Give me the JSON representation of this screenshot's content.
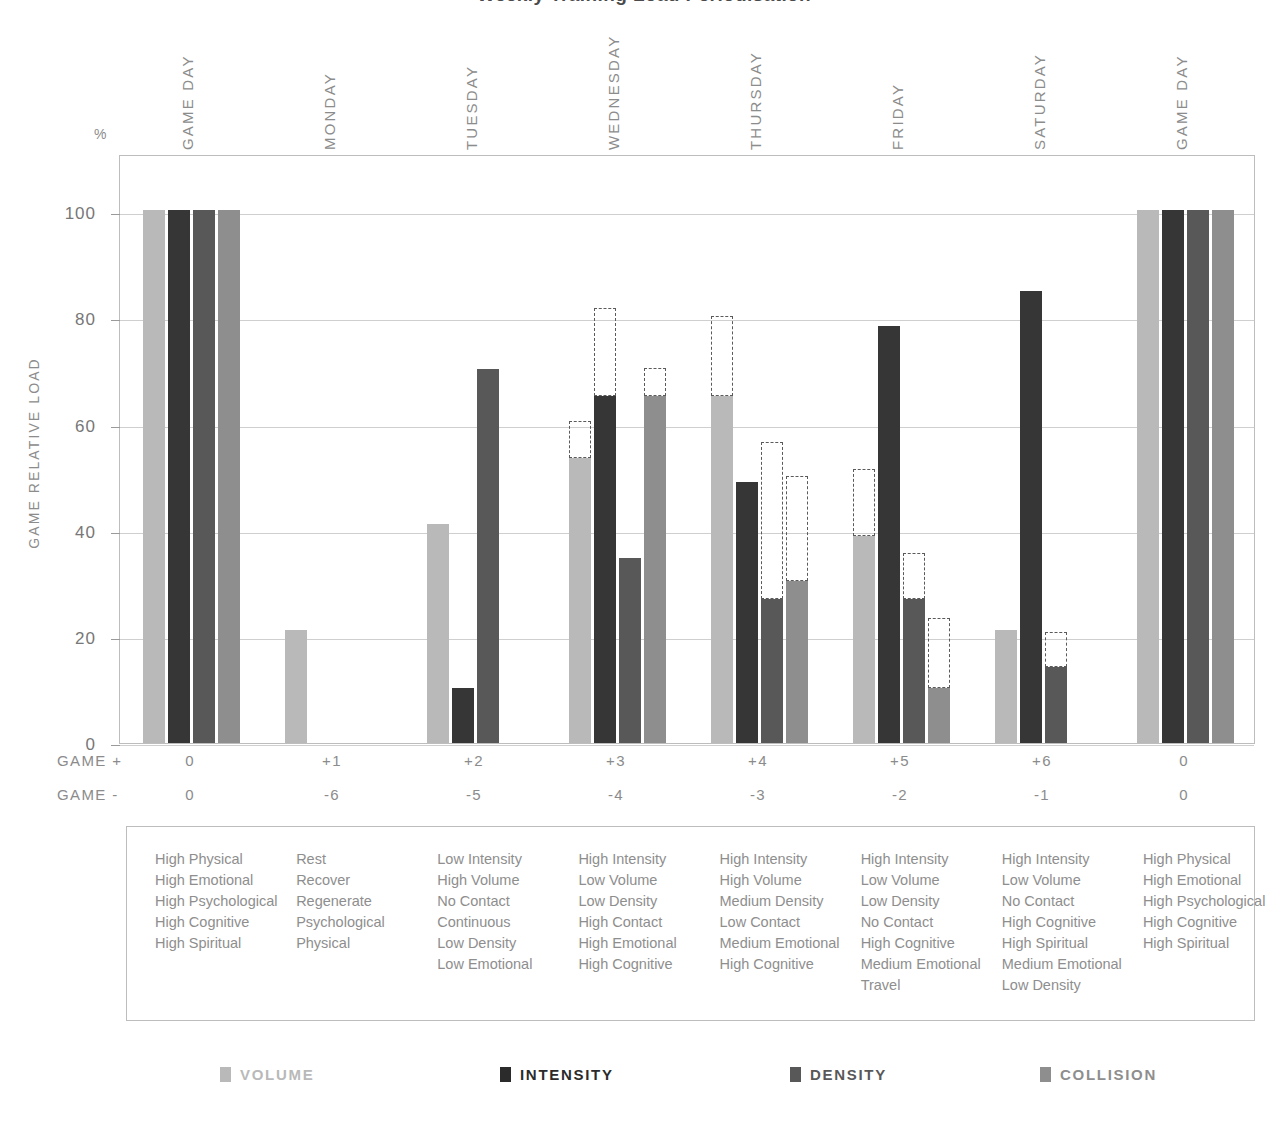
{
  "title": "Weekly Training Load Periodisation",
  "axes": {
    "y_unit": "%",
    "y_title": "GAME RELATIVE LOAD",
    "y_ticks": [
      0,
      20,
      40,
      60,
      80,
      100
    ],
    "y_min": 0,
    "y_max": 111,
    "row_label_plus": "GAME +",
    "row_label_minus": "GAME -"
  },
  "chart_data": {
    "type": "bar",
    "title": "Weekly Training Load Periodisation",
    "xlabel": "",
    "ylabel": "GAME RELATIVE LOAD",
    "y_unit": "%",
    "ylim": [
      0,
      111
    ],
    "grid": true,
    "legend_position": "bottom",
    "categories": [
      "GAME DAY",
      "MONDAY",
      "TUESDAY",
      "WEDNESDAY",
      "THURSDAY",
      "FRIDAY",
      "SATURDAY",
      "GAME DAY"
    ],
    "game_plus": [
      "0",
      "+1",
      "+2",
      "+3",
      "+4",
      "+5",
      "+6",
      "0"
    ],
    "game_minus": [
      "0",
      "-6",
      "-5",
      "-4",
      "-3",
      "-2",
      "-1",
      "0"
    ],
    "series": [
      {
        "name": "VOLUME",
        "color": "#b9b9b9",
        "values": [
          100.5,
          21.3,
          41.2,
          53.8,
          65.4,
          39.0,
          21.3,
          100.5
        ],
        "target_values": [
          null,
          null,
          null,
          60.6,
          80.4,
          51.6,
          null,
          null
        ]
      },
      {
        "name": "INTENSITY",
        "color": "#363636",
        "values": [
          100.5,
          null,
          10.4,
          65.4,
          49.2,
          78.5,
          85.2,
          100.5
        ],
        "target_values": [
          null,
          null,
          null,
          81.9,
          null,
          null,
          null,
          null
        ]
      },
      {
        "name": "DENSITY",
        "color": "#585858",
        "values": [
          100.5,
          null,
          70.4,
          34.8,
          27.1,
          27.2,
          14.3,
          100.5
        ],
        "target_values": [
          null,
          null,
          null,
          null,
          56.7,
          35.8,
          21.0,
          null
        ]
      },
      {
        "name": "COLLISION",
        "color": "#8e8e8e",
        "values": [
          100.5,
          null,
          null,
          65.4,
          30.6,
          10.4,
          null,
          100.5
        ],
        "target_values": [
          null,
          null,
          null,
          70.6,
          50.4,
          23.6,
          null,
          null
        ]
      }
    ]
  },
  "legend": [
    {
      "label": "VOLUME",
      "color": "#b9b9b9",
      "text_color": "#b9b9b9"
    },
    {
      "label": "INTENSITY",
      "color": "#2b2b2b",
      "text_color": "#2b2b2b"
    },
    {
      "label": "DENSITY",
      "color": "#585858",
      "text_color": "#585858"
    },
    {
      "label": "COLLISION",
      "color": "#8e8e8e",
      "text_color": "#8e8e8e"
    }
  ],
  "descriptors": [
    {
      "day": "GAME DAY",
      "lines": [
        "High Physical",
        "High Emotional",
        "High Psychological",
        "High Cognitive",
        "High Spiritual"
      ]
    },
    {
      "day": "MONDAY",
      "lines": [
        "Rest",
        "Recover",
        "Regenerate",
        "Psychological",
        "Physical"
      ]
    },
    {
      "day": "TUESDAY",
      "lines": [
        "Low Intensity",
        "High Volume",
        "No Contact",
        "Continuous",
        "Low Density",
        "Low Emotional"
      ]
    },
    {
      "day": "WEDNESDAY",
      "lines": [
        "High Intensity",
        "Low Volume",
        "Low Density",
        "High Contact",
        "High Emotional",
        "High Cognitive"
      ]
    },
    {
      "day": "THURSDAY",
      "lines": [
        "High Intensity",
        "High Volume",
        "Medium Density",
        "Low Contact",
        "Medium Emotional",
        "High Cognitive"
      ]
    },
    {
      "day": "FRIDAY",
      "lines": [
        "High Intensity",
        "Low Volume",
        "Low Density",
        "No Contact",
        "High Cognitive",
        "Medium Emotional",
        "Travel"
      ]
    },
    {
      "day": "SATURDAY",
      "lines": [
        "High Intensity",
        "Low Volume",
        "No Contact",
        "High Cognitive",
        "High Spiritual",
        "Medium Emotional",
        "Low Density"
      ]
    },
    {
      "day": "GAME DAY",
      "lines": [
        "High Physical",
        "High Emotional",
        "High Psychological",
        "High Cognitive",
        "High Spiritual"
      ]
    }
  ]
}
